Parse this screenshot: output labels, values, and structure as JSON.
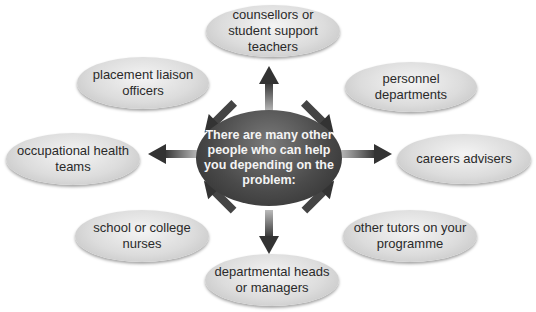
{
  "center": {
    "text": "There are many other people who can help you depending on the problem:"
  },
  "nodes": [
    {
      "id": "counsellors",
      "text": "counsellors or student support teachers"
    },
    {
      "id": "personnel",
      "text": "personnel departments"
    },
    {
      "id": "careers",
      "text": "careers advisers"
    },
    {
      "id": "tutors",
      "text": "other tutors on your programme"
    },
    {
      "id": "departmental",
      "text": "departmental heads or managers"
    },
    {
      "id": "nurses",
      "text": "school or college nurses"
    },
    {
      "id": "occupational",
      "text": "occupational health teams"
    },
    {
      "id": "placement",
      "text": "placement liaison officers"
    }
  ],
  "colors": {
    "center": "#4a4a4a",
    "node": "#dcdcdc",
    "arrow": "#333333"
  }
}
